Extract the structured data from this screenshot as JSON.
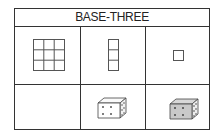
{
  "title": "BASE-THREE",
  "rows": [
    {
      "cells": [
        {
          "icon": "square-3x3-grid-icon",
          "value": 9
        },
        {
          "icon": "column-3-squares-icon",
          "value": 3
        },
        {
          "icon": "single-square-icon",
          "value": 1
        }
      ]
    },
    {
      "cells": [
        {
          "icon": "empty",
          "value": 0
        },
        {
          "icon": "die-white-icon",
          "value": ""
        },
        {
          "icon": "die-gray-icon",
          "value": ""
        }
      ]
    }
  ]
}
